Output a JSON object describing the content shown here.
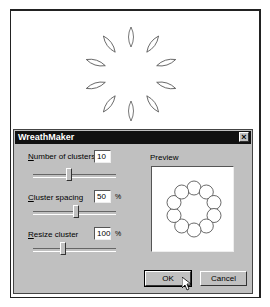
{
  "canvas": {
    "shape": "wreath-of-petals",
    "petal_count": 10
  },
  "dialog": {
    "title": "WreathMaker",
    "close_icon": "close-icon",
    "fields": [
      {
        "label_underlined": "N",
        "label_rest": "umber of clusters",
        "value": "10",
        "unit": "",
        "slider_pos": 0.42
      },
      {
        "label_underlined": "C",
        "label_rest": "luster spacing",
        "value": "50",
        "unit": "%",
        "slider_pos": 0.5
      },
      {
        "label_underlined": "R",
        "label_rest": "esize cluster",
        "value": "100",
        "unit": "%",
        "slider_pos": 0.33
      }
    ],
    "preview": {
      "label": "Preview",
      "circle_count": 10
    },
    "buttons": {
      "ok": "OK",
      "cancel": "Cancel"
    }
  }
}
